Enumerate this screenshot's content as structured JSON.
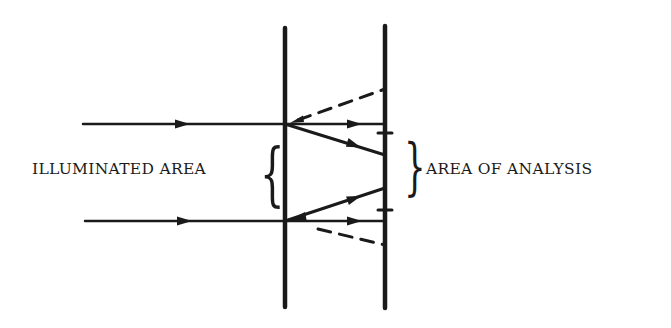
{
  "figure": {
    "labels": {
      "left": "ILLUMINATED AREA",
      "right": "AREA OF ANALYSIS"
    },
    "braces": {
      "left": "{",
      "right": "}"
    },
    "colors": {
      "ink": "#1a1a1a",
      "background": "#ffffff"
    },
    "elements": {
      "planes": [
        "left-plane",
        "right-plane"
      ],
      "incoming_rays": [
        "top-incoming-ray",
        "bottom-incoming-ray"
      ],
      "transmitted_rays": [
        "top-straight-ray",
        "top-diagonal-ray",
        "bottom-straight-ray",
        "bottom-diagonal-ray"
      ],
      "dashed_rays": [
        "top-dashed-ray",
        "bottom-dashed-ray"
      ],
      "tick_marks": [
        "upper-tick",
        "lower-tick"
      ]
    }
  }
}
